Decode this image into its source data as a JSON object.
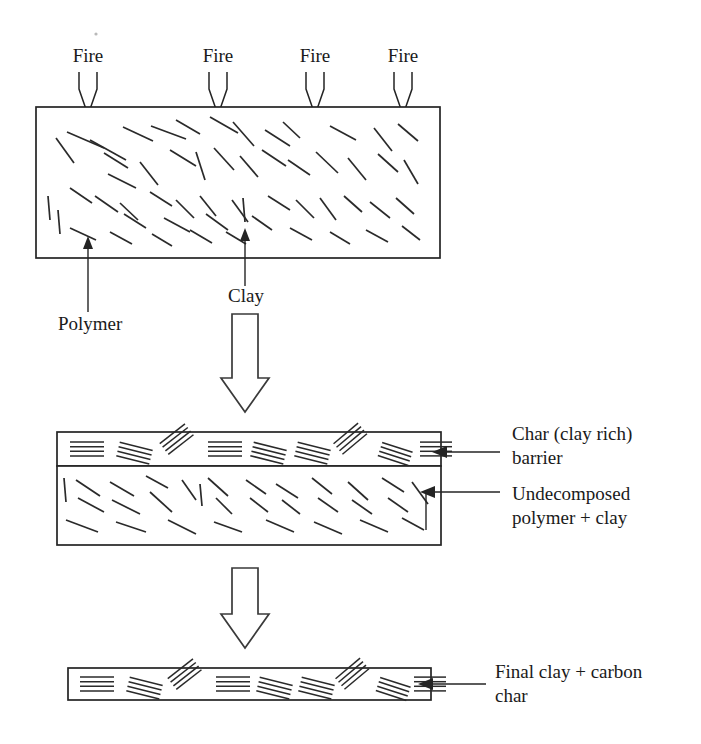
{
  "figure": {
    "stages": [
      {
        "id": "stage-initial",
        "name": "initial-nanocomposite",
        "description": "Polymer matrix with randomly dispersed clay platelets exposed to fire"
      },
      {
        "id": "stage-intermediate",
        "name": "char-barrier-forming",
        "description": "Clay rich char barrier over undecomposed polymer plus clay"
      },
      {
        "id": "stage-final",
        "name": "final-char",
        "description": "Final clay plus carbon char layer"
      }
    ]
  },
  "fire_labels": [
    {
      "text": "Fire",
      "x": 88
    },
    {
      "text": "Fire",
      "x": 218
    },
    {
      "text": "Fire",
      "x": 315
    },
    {
      "text": "Fire",
      "x": 403
    }
  ],
  "callouts": {
    "polymer": {
      "text": "Polymer",
      "x": 58,
      "y": 330
    },
    "clay": {
      "text": "Clay",
      "x": 228,
      "y": 302
    },
    "char_barrier": {
      "line1": "Char (clay rich)",
      "line2": "barrier",
      "x": 512,
      "y": 440
    },
    "undecomposed": {
      "line1": "Undecomposed",
      "line2": "polymer + clay",
      "x": 512,
      "y": 500
    },
    "final_char": {
      "line1": "Final clay + carbon",
      "line2": "char",
      "x": 495,
      "y": 678
    }
  },
  "geometry": {
    "top_box": {
      "x": 36,
      "y": 107,
      "w": 404,
      "h": 151
    },
    "mid_char_band": {
      "x": 57,
      "y": 432,
      "w": 384,
      "h": 34
    },
    "mid_polymer_band": {
      "x": 57,
      "y": 466,
      "w": 384,
      "h": 79
    },
    "bottom_bar": {
      "x": 68,
      "y": 668,
      "w": 363,
      "h": 32
    },
    "block_arrow_1": {
      "cx": 245,
      "top": 314,
      "bottom": 412,
      "shaft_w": 26,
      "head_w": 48,
      "head_h": 34
    },
    "block_arrow_2": {
      "cx": 245,
      "top": 568,
      "bottom": 648,
      "shaft_w": 26,
      "head_w": 48,
      "head_h": 34
    }
  },
  "colors": {
    "ink": "#242424",
    "platelet": "#2a2a2a",
    "background": "#ffffff"
  },
  "chart_data": {
    "type": "diagram",
    "top_box_platelets": [
      [
        67,
        132,
        104,
        148
      ],
      [
        123,
        127,
        153,
        141
      ],
      [
        90,
        140,
        126,
        160
      ],
      [
        176,
        120,
        200,
        134
      ],
      [
        151,
        126,
        186,
        139
      ],
      [
        210,
        117,
        238,
        133
      ],
      [
        233,
        122,
        254,
        146
      ],
      [
        283,
        122,
        300,
        138
      ],
      [
        265,
        130,
        290,
        146
      ],
      [
        330,
        126,
        356,
        140
      ],
      [
        374,
        128,
        392,
        151
      ],
      [
        398,
        124,
        418,
        141
      ],
      [
        56,
        138,
        74,
        163
      ],
      [
        104,
        153,
        128,
        168
      ],
      [
        140,
        162,
        158,
        185
      ],
      [
        170,
        150,
        196,
        166
      ],
      [
        196,
        152,
        205,
        180
      ],
      [
        214,
        148,
        234,
        170
      ],
      [
        240,
        156,
        258,
        177
      ],
      [
        262,
        150,
        286,
        166
      ],
      [
        288,
        160,
        310,
        175
      ],
      [
        316,
        152,
        338,
        173
      ],
      [
        348,
        158,
        366,
        180
      ],
      [
        378,
        154,
        398,
        172
      ],
      [
        404,
        160,
        418,
        184
      ],
      [
        48,
        196,
        50,
        220
      ],
      [
        70,
        188,
        92,
        203
      ],
      [
        95,
        196,
        118,
        212
      ],
      [
        120,
        203,
        138,
        220
      ],
      [
        150,
        192,
        172,
        206
      ],
      [
        176,
        200,
        194,
        218
      ],
      [
        200,
        196,
        216,
        216
      ],
      [
        124,
        214,
        146,
        228
      ],
      [
        164,
        218,
        190,
        232
      ],
      [
        206,
        214,
        228,
        230
      ],
      [
        232,
        200,
        248,
        222
      ],
      [
        243,
        198,
        245,
        222
      ],
      [
        252,
        216,
        272,
        230
      ],
      [
        268,
        196,
        290,
        210
      ],
      [
        296,
        200,
        314,
        218
      ],
      [
        320,
        198,
        336,
        220
      ],
      [
        344,
        196,
        362,
        212
      ],
      [
        370,
        202,
        390,
        218
      ],
      [
        396,
        198,
        414,
        214
      ],
      [
        70,
        228,
        96,
        240
      ],
      [
        110,
        232,
        132,
        244
      ],
      [
        152,
        234,
        172,
        246
      ],
      [
        190,
        230,
        212,
        243
      ],
      [
        226,
        232,
        246,
        244
      ],
      [
        290,
        228,
        312,
        240
      ],
      [
        330,
        232,
        350,
        244
      ],
      [
        366,
        230,
        388,
        242
      ],
      [
        402,
        226,
        420,
        240
      ],
      [
        108,
        174,
        136,
        188
      ],
      [
        58,
        210,
        60,
        234
      ]
    ],
    "mid_polymer_platelets": [
      [
        64,
        478,
        66,
        502
      ],
      [
        76,
        480,
        100,
        496
      ],
      [
        78,
        498,
        104,
        512
      ],
      [
        110,
        482,
        134,
        496
      ],
      [
        112,
        500,
        140,
        514
      ],
      [
        146,
        476,
        168,
        488
      ],
      [
        150,
        492,
        172,
        512
      ],
      [
        182,
        480,
        196,
        500
      ],
      [
        200,
        484,
        202,
        506
      ],
      [
        208,
        478,
        228,
        496
      ],
      [
        216,
        498,
        232,
        514
      ],
      [
        246,
        480,
        266,
        494
      ],
      [
        250,
        498,
        268,
        512
      ],
      [
        276,
        484,
        298,
        498
      ],
      [
        282,
        500,
        300,
        514
      ],
      [
        312,
        478,
        332,
        494
      ],
      [
        318,
        498,
        338,
        512
      ],
      [
        348,
        482,
        368,
        500
      ],
      [
        352,
        500,
        372,
        514
      ],
      [
        382,
        478,
        404,
        492
      ],
      [
        388,
        498,
        408,
        512
      ],
      [
        412,
        482,
        428,
        504
      ],
      [
        66,
        520,
        98,
        532
      ],
      [
        116,
        522,
        146,
        532
      ],
      [
        168,
        520,
        196,
        534
      ],
      [
        214,
        522,
        242,
        532
      ],
      [
        266,
        520,
        294,
        532
      ],
      [
        314,
        522,
        342,
        534
      ],
      [
        360,
        520,
        388,
        532
      ],
      [
        402,
        518,
        424,
        530
      ]
    ],
    "stack_groups_mid": [
      {
        "x": 70,
        "y": 449,
        "w": 34,
        "angle": 0,
        "n": 4
      },
      {
        "x": 118,
        "y": 449,
        "w": 34,
        "angle": 14,
        "n": 4
      },
      {
        "x": 164,
        "y": 449,
        "w": 32,
        "angle": -38,
        "n": 4
      },
      {
        "x": 208,
        "y": 449,
        "w": 34,
        "angle": 0,
        "n": 4
      },
      {
        "x": 252,
        "y": 449,
        "w": 34,
        "angle": 14,
        "n": 4
      },
      {
        "x": 296,
        "y": 449,
        "w": 34,
        "angle": 14,
        "n": 4
      },
      {
        "x": 338,
        "y": 449,
        "w": 32,
        "angle": -40,
        "n": 4
      },
      {
        "x": 380,
        "y": 449,
        "w": 32,
        "angle": 18,
        "n": 4
      },
      {
        "x": 420,
        "y": 449,
        "w": 32,
        "angle": 0,
        "n": 4
      }
    ],
    "stack_groups_bottom": [
      {
        "x": 80,
        "y": 684,
        "w": 34,
        "angle": 0,
        "n": 4
      },
      {
        "x": 128,
        "y": 684,
        "w": 34,
        "angle": 14,
        "n": 4
      },
      {
        "x": 172,
        "y": 684,
        "w": 32,
        "angle": -38,
        "n": 4
      },
      {
        "x": 216,
        "y": 684,
        "w": 34,
        "angle": 0,
        "n": 4
      },
      {
        "x": 258,
        "y": 684,
        "w": 34,
        "angle": 14,
        "n": 4
      },
      {
        "x": 300,
        "y": 684,
        "w": 34,
        "angle": 14,
        "n": 4
      },
      {
        "x": 340,
        "y": 684,
        "w": 32,
        "angle": -40,
        "n": 4
      },
      {
        "x": 378,
        "y": 684,
        "w": 32,
        "angle": 18,
        "n": 4
      },
      {
        "x": 414,
        "y": 684,
        "w": 32,
        "angle": 0,
        "n": 4
      }
    ]
  }
}
